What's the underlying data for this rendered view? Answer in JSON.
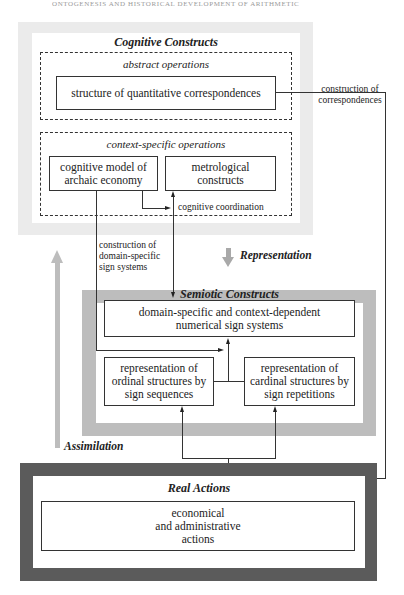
{
  "page": {
    "running_head": "ONTOGENESIS AND HISTORICAL DEVELOPMENT OF ARITHMETIC"
  },
  "cognitive": {
    "title": "Cognitive Constructs",
    "abstract": {
      "title": "abstract operations",
      "box": "structure of quantitative correspondences"
    },
    "context": {
      "title": "context-specific operations",
      "model_box": "cognitive model of\narchaic economy",
      "metro_box": "metrological\nconstructs",
      "coordination_label": "cognitive coordination"
    }
  },
  "connectors": {
    "correspondences_label": "construction of\ncorrespondences",
    "domain_label": "construction of\ndomain-specific\nsign systems",
    "representation_label": "Representation",
    "assimilation_label": "Assimilation"
  },
  "semiotic": {
    "title": "Semiotic Constructs",
    "domain_box": "domain-specific and context-dependent\nnumerical sign systems",
    "ordinal_box": "representation of\nordinal structures by\nsign sequences",
    "cardinal_box": "representation of\ncardinal structures by\nsign repetitions"
  },
  "real": {
    "title": "Real Actions",
    "box": "economical\nand administrative\nactions"
  },
  "colors": {
    "cognitive_frame": "#ebebeb",
    "semiotic_frame": "#bdbdbd",
    "real_frame": "#5b5b5b",
    "assimilation_arrow": "#bdbdbd",
    "representation_arrow": "#a9a9a9"
  }
}
